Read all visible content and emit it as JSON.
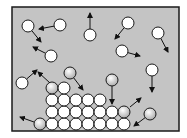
{
  "diagram": {
    "colors": {
      "background": "#ffffff",
      "frame_fill": "#c4c4c4",
      "frame_stroke": "#1a1a1a",
      "particle_stroke": "#1a1a1a",
      "particle_fill": "#ffffff",
      "particle_shaded": "#bdbdbd",
      "arrow": "#111111"
    },
    "frame": {
      "x": 12,
      "y": 7,
      "width": 167,
      "height": 124
    },
    "radius": 6,
    "gas_particles": [
      {
        "cx": 28,
        "cy": 26,
        "shaded": false,
        "arrow": {
          "x2": 41,
          "y2": 42
        }
      },
      {
        "cx": 60,
        "cy": 25,
        "shaded": false,
        "arrow": {
          "x2": 39,
          "y2": 29
        }
      },
      {
        "cx": 90,
        "cy": 35,
        "shaded": false,
        "arrow": {
          "x2": 90,
          "y2": 13
        }
      },
      {
        "cx": 128,
        "cy": 23,
        "shaded": false,
        "arrow": {
          "x2": 115,
          "y2": 39
        }
      },
      {
        "cx": 158,
        "cy": 33,
        "shaded": false,
        "arrow": {
          "x2": 168,
          "y2": 52
        }
      },
      {
        "cx": 51,
        "cy": 56,
        "shaded": false,
        "arrow": {
          "x2": 33,
          "y2": 47
        }
      },
      {
        "cx": 122,
        "cy": 51,
        "shaded": false,
        "arrow": {
          "x2": 140,
          "y2": 56
        }
      },
      {
        "cx": 22,
        "cy": 83,
        "shaded": false,
        "arrow": {
          "x2": 37,
          "y2": 70
        }
      },
      {
        "cx": 70,
        "cy": 73,
        "shaded": true,
        "arrow": {
          "x2": 83,
          "y2": 90
        }
      },
      {
        "cx": 112,
        "cy": 80,
        "shaded": true,
        "arrow": {
          "x2": 112,
          "y2": 104
        }
      },
      {
        "cx": 152,
        "cy": 70,
        "shaded": false,
        "arrow": {
          "x2": 152,
          "y2": 92
        }
      },
      {
        "cx": 150,
        "cy": 114,
        "shaded": true,
        "arrow": {
          "x2": 134,
          "y2": 126
        }
      }
    ],
    "escaping_particles": [
      {
        "from": {
          "x": 50,
          "y": 83
        },
        "to": {
          "x": 38,
          "y": 72
        }
      },
      {
        "from": {
          "x": 130,
          "y": 107
        },
        "to": {
          "x": 141,
          "y": 98
        }
      },
      {
        "from": {
          "x": 34,
          "y": 122
        },
        "to": {
          "x": 20,
          "y": 117
        }
      }
    ],
    "lattice": [
      {
        "cx": 40,
        "cy": 124,
        "shaded": true
      },
      {
        "cx": 52,
        "cy": 124,
        "shaded": false
      },
      {
        "cx": 64,
        "cy": 124,
        "shaded": false
      },
      {
        "cx": 76,
        "cy": 124,
        "shaded": false
      },
      {
        "cx": 88,
        "cy": 124,
        "shaded": false
      },
      {
        "cx": 100,
        "cy": 124,
        "shaded": false
      },
      {
        "cx": 112,
        "cy": 124,
        "shaded": false
      },
      {
        "cx": 124,
        "cy": 124,
        "shaded": false
      },
      {
        "cx": 52,
        "cy": 112,
        "shaded": false
      },
      {
        "cx": 64,
        "cy": 112,
        "shaded": false
      },
      {
        "cx": 76,
        "cy": 112,
        "shaded": false
      },
      {
        "cx": 88,
        "cy": 112,
        "shaded": false
      },
      {
        "cx": 100,
        "cy": 112,
        "shaded": false
      },
      {
        "cx": 112,
        "cy": 112,
        "shaded": false
      },
      {
        "cx": 124,
        "cy": 112,
        "shaded": true
      },
      {
        "cx": 52,
        "cy": 100,
        "shaded": false
      },
      {
        "cx": 64,
        "cy": 100,
        "shaded": false
      },
      {
        "cx": 76,
        "cy": 100,
        "shaded": false
      },
      {
        "cx": 88,
        "cy": 100,
        "shaded": false
      },
      {
        "cx": 100,
        "cy": 100,
        "shaded": false
      },
      {
        "cx": 52,
        "cy": 88,
        "shaded": true
      },
      {
        "cx": 64,
        "cy": 88,
        "shaded": false
      }
    ]
  }
}
